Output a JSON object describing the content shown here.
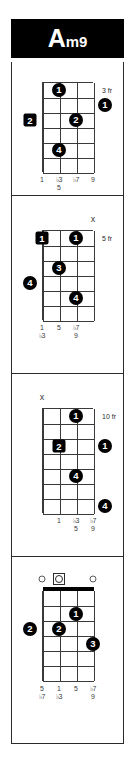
{
  "title": {
    "root": "A",
    "suffix": "m9",
    "full": "Am9"
  },
  "instrument": {
    "strings": 4,
    "string_labels": [
      "1",
      "2",
      "3",
      "4"
    ]
  },
  "colors": {
    "title_bg": "#000000",
    "title_fg": "#ffffff",
    "dot": "#000000",
    "dot_text": "#ffffff",
    "grid": "#3a3a3a",
    "frame": "#2b2b2b",
    "page_bg": "#ffffff"
  },
  "diagrams": [
    {
      "index": 1,
      "position_label": "3 fr",
      "frets": 6,
      "open_nut": false,
      "top_markers": [],
      "dots": [
        {
          "string": 2,
          "fret": 1,
          "finger": "1",
          "shape": "circle",
          "outside": false
        },
        {
          "string": 4,
          "fret": 2,
          "finger": "1",
          "shape": "circle",
          "outside": "right"
        },
        {
          "string": 1,
          "fret": 3,
          "finger": "2",
          "shape": "square",
          "outside": "left"
        },
        {
          "string": 3,
          "fret": 3,
          "finger": "2",
          "shape": "circle",
          "outside": false
        },
        {
          "string": 2,
          "fret": 5,
          "finger": "4",
          "shape": "circle",
          "outside": false
        }
      ],
      "intervals": [
        {
          "string": 1,
          "lines": [
            "1"
          ]
        },
        {
          "string": 2,
          "lines": [
            "♭3",
            "5"
          ]
        },
        {
          "string": 3,
          "lines": [
            "♭7"
          ]
        },
        {
          "string": 4,
          "lines": [
            "9"
          ]
        }
      ]
    },
    {
      "index": 2,
      "position_label": "5 fr",
      "frets": 6,
      "open_nut": false,
      "top_markers": [
        {
          "string": 4,
          "type": "mute",
          "glyph": "x"
        }
      ],
      "dots": [
        {
          "string": 1,
          "fret": 1,
          "finger": "1",
          "shape": "square",
          "outside": false
        },
        {
          "string": 3,
          "fret": 1,
          "finger": "1",
          "shape": "circle",
          "outside": false
        },
        {
          "string": 2,
          "fret": 3,
          "finger": "3",
          "shape": "circle",
          "outside": false
        },
        {
          "string": 1,
          "fret": 4,
          "finger": "4",
          "shape": "circle",
          "outside": "left"
        },
        {
          "string": 3,
          "fret": 5,
          "finger": "4",
          "shape": "circle",
          "outside": false
        }
      ],
      "intervals": [
        {
          "string": 1,
          "lines": [
            "1",
            "♭3"
          ]
        },
        {
          "string": 2,
          "lines": [
            "5"
          ]
        },
        {
          "string": 3,
          "lines": [
            "♭7",
            "9"
          ]
        }
      ]
    },
    {
      "index": 3,
      "position_label": "10 fr",
      "frets": 7,
      "open_nut": false,
      "top_markers": [
        {
          "string": 1,
          "type": "mute",
          "glyph": "x"
        }
      ],
      "dots": [
        {
          "string": 3,
          "fret": 1,
          "finger": "1",
          "shape": "circle",
          "outside": false
        },
        {
          "string": 2,
          "fret": 3,
          "finger": "2",
          "shape": "square",
          "outside": false
        },
        {
          "string": 4,
          "fret": 3,
          "finger": "1",
          "shape": "circle",
          "outside": "right"
        },
        {
          "string": 3,
          "fret": 5,
          "finger": "4",
          "shape": "circle",
          "outside": false
        },
        {
          "string": 4,
          "fret": 7,
          "finger": "4",
          "shape": "circle",
          "outside": "right"
        }
      ],
      "intervals": [
        {
          "string": 2,
          "lines": [
            "1"
          ]
        },
        {
          "string": 3,
          "lines": [
            "♭3",
            "5"
          ]
        },
        {
          "string": 4,
          "lines": [
            "♭7",
            "9"
          ]
        }
      ]
    },
    {
      "index": 4,
      "position_label": "",
      "frets": 6,
      "open_nut": true,
      "top_markers": [
        {
          "string": 1,
          "type": "open",
          "glyph": "o"
        },
        {
          "string": 2,
          "type": "root-open",
          "glyph": "o"
        },
        {
          "string": 4,
          "type": "open",
          "glyph": "o"
        }
      ],
      "dots": [
        {
          "string": 3,
          "fret": 2,
          "finger": "1",
          "shape": "circle",
          "outside": false
        },
        {
          "string": 1,
          "fret": 3,
          "finger": "2",
          "shape": "circle",
          "outside": "left"
        },
        {
          "string": 2,
          "fret": 3,
          "finger": "2",
          "shape": "circle",
          "outside": false
        },
        {
          "string": 4,
          "fret": 4,
          "finger": "3",
          "shape": "circle",
          "outside": false
        }
      ],
      "intervals": [
        {
          "string": 1,
          "lines": [
            "5",
            "♭7"
          ]
        },
        {
          "string": 2,
          "lines": [
            "1",
            "♭3"
          ]
        },
        {
          "string": 3,
          "lines": [
            "5"
          ]
        },
        {
          "string": 4,
          "lines": [
            "♭7",
            "9"
          ]
        }
      ]
    }
  ]
}
